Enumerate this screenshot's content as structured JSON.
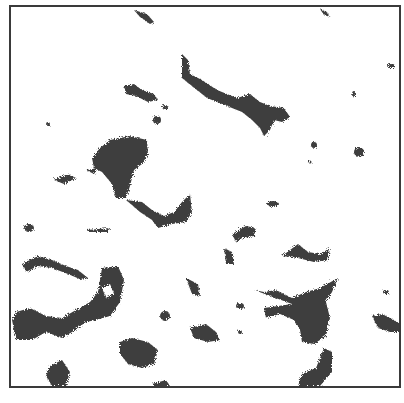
{
  "image": {
    "description": "Binarized grayscale micrograph of dark irregular clusters on white background inside a thin square frame",
    "frame_color": "#3a3a3a",
    "blob_color": "#2b2b2b",
    "background": "#ffffff"
  }
}
